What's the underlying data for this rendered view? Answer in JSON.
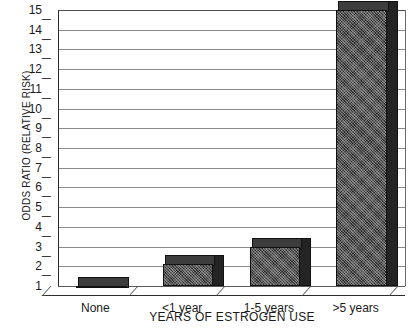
{
  "chart_data": {
    "type": "bar",
    "title": "",
    "xlabel": "YEARS OF ESTROGEN USE",
    "ylabel": "ODDS RATIO (RELATIVE RISK)",
    "categories": [
      "None",
      "<1 year",
      "1-5 years",
      ">5 years"
    ],
    "values": [
      1.0,
      2.1,
      3.0,
      15.0
    ],
    "ylim": [
      1,
      15
    ],
    "yticks": [
      1,
      2,
      3,
      4,
      5,
      6,
      7,
      8,
      9,
      10,
      11,
      12,
      13,
      14,
      15
    ],
    "ytick_labels": [
      "1",
      "2",
      "3",
      "4",
      "5",
      "6",
      "7",
      "8",
      "9",
      "10",
      "11",
      "12",
      "13",
      "14",
      "15"
    ],
    "grid": true,
    "legend": null,
    "style": "3d-bar",
    "bar_color": "#2f2f2f",
    "grid_color": "#8a8a8a",
    "axis_color": "#2b2b2b",
    "background": "#ffffff"
  }
}
